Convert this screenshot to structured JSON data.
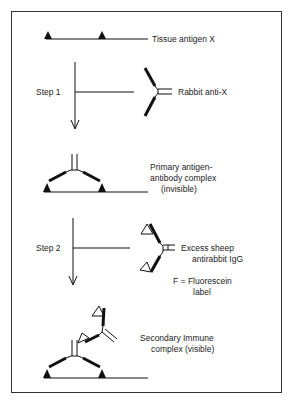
{
  "labels": {
    "tissue_antigen": "Tissue antigen X",
    "step1": "Step 1",
    "rabbit_anti_x": "Rabbit anti-X",
    "primary_complex_line1": "Primary antigen-",
    "primary_complex_line2": "antibody complex",
    "primary_complex_line3": "(invisible)",
    "step2": "Step 2",
    "sheep_line1": "Excess sheep",
    "sheep_line2": "antirabbit IgG",
    "fluorescein_line1": "F = Fluorescein",
    "fluorescein_line2": "label",
    "secondary_line1": "Secondary Immune",
    "secondary_line2": "complex (visible)",
    "fluor_glyph": "F"
  },
  "colors": {
    "ink": "#111111",
    "frame": "#333333",
    "background": "#ffffff"
  }
}
